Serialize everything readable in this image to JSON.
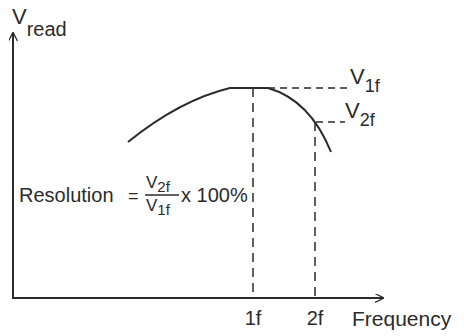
{
  "diagram": {
    "type": "frequency-response-resolution",
    "y_axis": {
      "label_main": "V",
      "label_sub": "read"
    },
    "x_axis": {
      "label": "Frequency",
      "ticks": [
        "1f",
        "2f"
      ]
    },
    "levels": [
      {
        "main": "V",
        "sub": "1f"
      },
      {
        "main": "V",
        "sub": "2f"
      }
    ],
    "formula": {
      "lhs": "Resolution",
      "equals": "=",
      "numerator": {
        "main": "V",
        "sub": "2f"
      },
      "denominator": {
        "main": "V",
        "sub": "1f"
      },
      "rhs": "x 100%"
    },
    "colors": {
      "ink": "#2b2b2b",
      "background": "#ffffff"
    }
  }
}
